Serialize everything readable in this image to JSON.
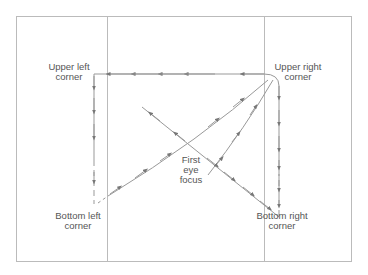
{
  "diagram": {
    "labels": {
      "upper_left": [
        "Upper left",
        "corner"
      ],
      "upper_right": [
        "Upper right",
        "corner"
      ],
      "first_focus": [
        "First",
        "eye",
        "focus"
      ],
      "bottom_left": [
        "Bottom left",
        "corner"
      ],
      "bottom_right": [
        "Bottom right",
        "corner"
      ]
    },
    "colors": {
      "frame": "#bbbbbb",
      "path": "#999999",
      "arrow": "#777777",
      "text": "#555555"
    },
    "sequence": [
      "First eye focus",
      "Upper left corner",
      "Upper right corner",
      "Bottom left corner",
      "Bottom right corner"
    ]
  }
}
